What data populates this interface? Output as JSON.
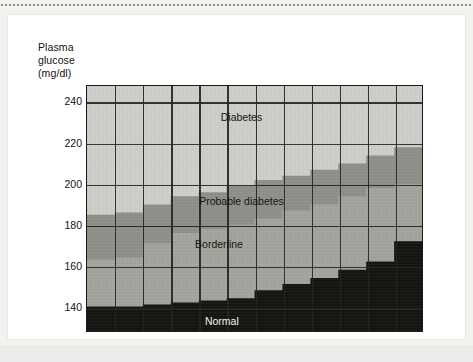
{
  "figure": {
    "y_axis_title": "Plasma\nglucose\n(mg/dl)",
    "x_axis_title": "Age"
  },
  "chart_data": {
    "type": "area",
    "title": "",
    "subtitle": "",
    "xlabel": "Age",
    "ylabel": "Plasma glucose (mg/dl)",
    "xlim": [
      20,
      80
    ],
    "ylim": [
      128,
      248
    ],
    "xticks": [
      20,
      30,
      40,
      50,
      60,
      70,
      80
    ],
    "xtick_labels": [
      "20",
      "30",
      "40",
      "50",
      "60",
      "70",
      "80"
    ],
    "yticks": [
      140,
      160,
      180,
      200,
      220,
      240
    ],
    "ytick_labels": [
      "140",
      "160",
      "180",
      "200",
      "220",
      "240"
    ],
    "grid": true,
    "grid_x_step": 5,
    "grid_y_step": 20,
    "legend": "in-plot labels",
    "step_edges": [
      20,
      25,
      30,
      35,
      40,
      45,
      50,
      55,
      60,
      65,
      70,
      75,
      80
    ],
    "series": [
      {
        "name": "Normal",
        "label": "Normal",
        "color": "#151512",
        "description": "upper boundary of the normal band, mg/dl, per 5-year age step",
        "values": [
          140,
          140,
          141,
          142,
          143,
          144,
          148,
          151,
          154,
          158,
          162,
          172
        ]
      },
      {
        "name": "Borderline",
        "label": "Borderline",
        "color": "#a3a39e",
        "description": "upper boundary of the borderline band, mg/dl, per 5-year age step",
        "values": [
          163,
          164,
          171,
          176,
          178,
          180,
          183,
          187,
          190,
          194,
          198,
          200
        ]
      },
      {
        "name": "Probable diabetes",
        "label": "Probable diabetes",
        "color": "#8f8f8a",
        "description": "upper boundary of the probable-diabetes band, mg/dl, per 5-year age step",
        "values": [
          185,
          186,
          190,
          194,
          196,
          199,
          202,
          204,
          207,
          210,
          214,
          218
        ]
      },
      {
        "name": "Diabetes",
        "label": "Diabetes",
        "color": "#cdcdc9",
        "description": "region above the probable-diabetes boundary, up to the top of the axis",
        "values": [
          248,
          248,
          248,
          248,
          248,
          248,
          248,
          248,
          248,
          248,
          248,
          248
        ]
      }
    ],
    "annotations": [
      {
        "text": "Diabetes",
        "x": 47.5,
        "y": 233,
        "on_dark": false
      },
      {
        "text": "Probable diabetes",
        "x": 47.5,
        "y": 192,
        "on_dark": false
      },
      {
        "text": "Borderline",
        "x": 43.5,
        "y": 171,
        "on_dark": false
      },
      {
        "text": "Normal",
        "x": 44.0,
        "y": 134,
        "on_dark": true
      }
    ]
  },
  "colors": {
    "normal": "#151512",
    "borderline": "#a3a39e",
    "probable_diabetes": "#8f8f8a",
    "diabetes": "#cdcdc9",
    "axis": "#1a1a18",
    "text": "#13120f",
    "page": "#f2f2ef",
    "card": "#ffffff"
  }
}
